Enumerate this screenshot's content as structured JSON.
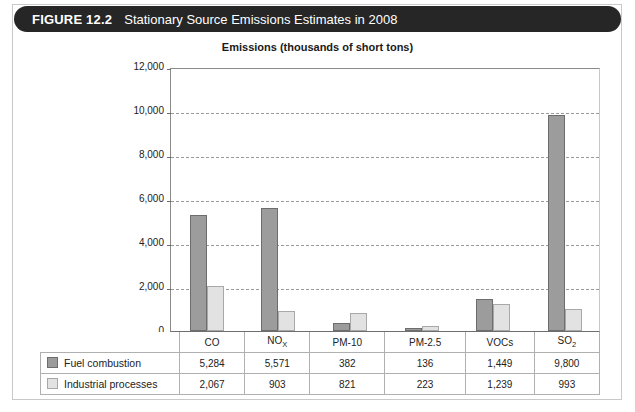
{
  "figure": {
    "label": "FIGURE 12.2",
    "title": "Stationary Source Emissions Estimates in 2008"
  },
  "colors": {
    "header_bar": "#262626",
    "series_fuel_combustion": "#9c9c9c",
    "series_industrial_processes": "#e2e2e2",
    "gridline": "#9a9a9a",
    "axis": "#6e6e6e"
  },
  "chart_data": {
    "type": "bar",
    "title": "Emissions (thousands of short tons)",
    "xlabel": "",
    "ylabel": "",
    "ylim": [
      0,
      12000
    ],
    "yticks": [
      0,
      2000,
      4000,
      6000,
      8000,
      10000,
      12000
    ],
    "ytick_labels": [
      "0",
      "2,000",
      "4,000",
      "6,000",
      "8,000",
      "10,000",
      "12,000"
    ],
    "grid": true,
    "grid_style": "dashed-horizontal",
    "legend_position": "table-row-headers",
    "categories": [
      "CO",
      "NOx",
      "PM-10",
      "PM-2.5",
      "VOCs",
      "SO2"
    ],
    "category_labels": [
      {
        "base": "CO",
        "sub": ""
      },
      {
        "base": "NO",
        "sub": "X"
      },
      {
        "base": "PM-10",
        "sub": ""
      },
      {
        "base": "PM-2.5",
        "sub": ""
      },
      {
        "base": "VOCs",
        "sub": ""
      },
      {
        "base": "SO",
        "sub": "2"
      }
    ],
    "series": [
      {
        "name": "Fuel combustion",
        "values": [
          5284,
          5571,
          382,
          136,
          1449,
          9800
        ],
        "value_labels": [
          "5,284",
          "5,571",
          "382",
          "136",
          "1,449",
          "9,800"
        ],
        "color": "#9c9c9c"
      },
      {
        "name": "Industrial processes",
        "values": [
          2067,
          903,
          821,
          223,
          1239,
          993
        ],
        "value_labels": [
          "2,067",
          "903",
          "821",
          "223",
          "1,239",
          "993"
        ],
        "color": "#e2e2e2"
      }
    ]
  }
}
